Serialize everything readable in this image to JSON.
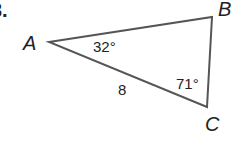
{
  "problem_number": "3.",
  "vertices": {
    "A": "A",
    "B": "B",
    "C": "C"
  },
  "angles": {
    "A": "32°",
    "C": "71°"
  },
  "side_AC": "8",
  "colors": {
    "stroke": "#555555",
    "text": "#222222"
  }
}
